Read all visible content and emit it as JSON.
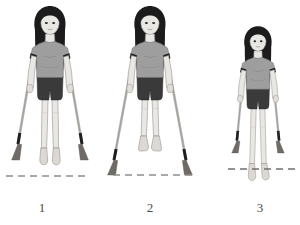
{
  "illustration": {
    "title": "Crutch gait sequence",
    "subject": "girl-with-forearm-crutches",
    "panel_count": 3,
    "background_color": "#ffffff"
  },
  "palette": {
    "hair": "#1c1c1c",
    "skin": "#e9e7e4",
    "skin_shade": "#cfcbc6",
    "skin_outline": "#8e8a86",
    "shirt": "#9e9e9e",
    "shirt_shade": "#8a8a8a",
    "shirt_outline": "#6e6e6e",
    "shorts": "#3a3a3a",
    "shorts_outline": "#242424",
    "crutch_shaft": "#b8b5b1",
    "crutch_outline": "#7d7a76",
    "crutch_tip": "#6f6c68",
    "cuff": "#1f1f1f",
    "ground_line": "#8d8d8d",
    "caption": "#4a4a4a"
  },
  "panels": [
    {
      "id": "panel-1",
      "label": "1",
      "label_x": 42,
      "label_y": 212,
      "caption_text": "1",
      "figure_origin_x": 50,
      "figure_origin_y": 8,
      "figure_scale": 1.0,
      "stance": "standing-feet-and-crutches-on-ground",
      "feet_on_ground": true,
      "crutches_on_ground": true,
      "crutch_spread": "wide",
      "ground_line": {
        "y": 176,
        "x_start": 6,
        "x_end": 90,
        "dash_pattern": "7 5",
        "stroke_width": 1.4
      }
    },
    {
      "id": "panel-2",
      "label": "2",
      "label_x": 150,
      "label_y": 212,
      "caption_text": "2",
      "figure_origin_x": 150,
      "figure_origin_y": 8,
      "figure_scale": 1.0,
      "stance": "swing-through-feet-lifted",
      "feet_on_ground": false,
      "crutches_on_ground": true,
      "crutch_spread": "wide-forward",
      "ground_line": {
        "y": 175,
        "x_start": 113,
        "x_end": 196,
        "dash_pattern": "7 5",
        "stroke_width": 1.4
      }
    },
    {
      "id": "panel-3",
      "label": "3",
      "label_x": 260,
      "label_y": 212,
      "caption_text": "3",
      "figure_origin_x": 258,
      "figure_origin_y": 28,
      "figure_scale": 0.88,
      "stance": "stepping-down-feet-below-line",
      "feet_on_ground": false,
      "crutches_on_ground": true,
      "crutch_spread": "narrow",
      "ground_line": {
        "y": 169,
        "x_start": 228,
        "x_end": 297,
        "dash_pattern": "7 5",
        "stroke_width": 1.4
      }
    }
  ],
  "figure_parts": {
    "hair_name": "long-dark-hair-with-bangs",
    "shirt_name": "gray-short-sleeve-tshirt",
    "shorts_name": "dark-shorts",
    "crutch_name": "forearm-crutch",
    "cuff_name": "crutch-forearm-cuff",
    "tip_name": "crutch-rubber-tip",
    "foot_name": "bare-foot"
  }
}
